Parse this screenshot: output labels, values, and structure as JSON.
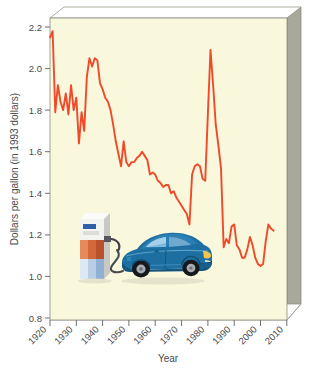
{
  "chart_data": {
    "type": "line",
    "title": "",
    "xlabel": "Year",
    "ylabel": "Dollars per gallon (in 1993 dollars)",
    "xlim": [
      1920,
      2010
    ],
    "ylim": [
      0.8,
      2.2
    ],
    "xticks": [
      "1920",
      "1930",
      "1940",
      "1950",
      "1960",
      "1970",
      "1980",
      "1990",
      "2000",
      "2010"
    ],
    "yticks": [
      "0.8",
      "1.0",
      "1.2",
      "1.4",
      "1.6",
      "1.8",
      "2.0",
      "2.2"
    ],
    "grid": false,
    "legend": false,
    "line_color": "#ef4a2a",
    "plot_background": "#f9f7dc",
    "frame_color": "#9a9a8e",
    "series": [
      {
        "name": "Gasoline price",
        "x": [
          1920,
          1921,
          1922,
          1923,
          1924,
          1925,
          1926,
          1927,
          1928,
          1929,
          1930,
          1931,
          1932,
          1933,
          1934,
          1935,
          1936,
          1937,
          1938,
          1939,
          1940,
          1941,
          1942,
          1943,
          1944,
          1945,
          1946,
          1947,
          1948,
          1949,
          1950,
          1951,
          1952,
          1953,
          1954,
          1955,
          1956,
          1957,
          1958,
          1959,
          1960,
          1961,
          1962,
          1963,
          1964,
          1965,
          1966,
          1967,
          1968,
          1969,
          1970,
          1971,
          1972,
          1973,
          1974,
          1975,
          1976,
          1977,
          1978,
          1979,
          1980,
          1981,
          1982,
          1983,
          1984,
          1985,
          1986,
          1987,
          1988,
          1989,
          1990,
          1991,
          1992,
          1993,
          1994,
          1995,
          1996,
          1997,
          1998,
          1999,
          2000,
          2001,
          2002,
          2003,
          2004,
          2005
        ],
        "y": [
          2.15,
          2.18,
          1.79,
          1.92,
          1.84,
          1.8,
          1.88,
          1.78,
          1.92,
          1.8,
          1.86,
          1.64,
          1.79,
          1.7,
          1.96,
          2.05,
          2.01,
          2.05,
          2.04,
          1.93,
          1.9,
          1.86,
          1.84,
          1.8,
          1.73,
          1.65,
          1.59,
          1.53,
          1.65,
          1.55,
          1.53,
          1.55,
          1.55,
          1.57,
          1.58,
          1.6,
          1.58,
          1.56,
          1.49,
          1.5,
          1.49,
          1.46,
          1.45,
          1.43,
          1.44,
          1.44,
          1.4,
          1.41,
          1.38,
          1.36,
          1.34,
          1.32,
          1.3,
          1.25,
          1.49,
          1.53,
          1.54,
          1.53,
          1.47,
          1.46,
          1.78,
          2.09,
          1.92,
          1.73,
          1.63,
          1.52,
          1.14,
          1.18,
          1.16,
          1.24,
          1.25,
          1.15,
          1.13,
          1.09,
          1.09,
          1.13,
          1.19,
          1.15,
          1.09,
          1.06,
          1.05,
          1.06,
          1.17,
          1.25,
          1.23,
          1.22
        ]
      }
    ],
    "illustration": {
      "pump_label": "gas-pump",
      "car_label": "blue-sedan-car",
      "hose_label": "fuel-hose"
    }
  }
}
